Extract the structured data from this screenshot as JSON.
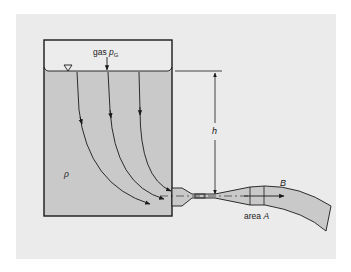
{
  "diagram": {
    "labels": {
      "gas": "gas",
      "gas_pressure_symbol": "p",
      "gas_pressure_subscript": "G",
      "density": "ρ",
      "height": "h",
      "point_b": "B",
      "area_prefix": "area",
      "area_symbol": "A",
      "free_surface_symbol": "∇"
    },
    "colors": {
      "panel_background": "#ebebeb",
      "liquid": "#c9c9c9",
      "gas_region": "#ebebeb",
      "outline": "#1a1a1a"
    },
    "elements": [
      "tank",
      "gas space",
      "liquid with free surface",
      "three streamlines curving toward outlet",
      "nozzle with throat",
      "diverging section with area A",
      "free jet bending downward",
      "height dimension h"
    ]
  }
}
